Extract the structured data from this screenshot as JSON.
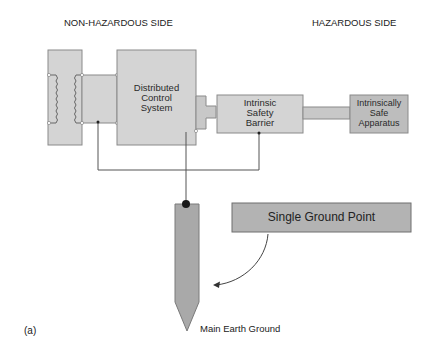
{
  "headings": {
    "left": "NON-HAZARDOUS SIDE",
    "right": "HAZARDOUS SIDE"
  },
  "blocks": {
    "dcs": [
      "Distributed",
      "Control",
      "System"
    ],
    "barrier": [
      "Intrinsic",
      "Safety",
      "Barrier"
    ],
    "apparatus": [
      "Intrinsically",
      "Safe",
      "Apparatus"
    ]
  },
  "callout": "Single Ground Point",
  "ground_label": "Main Earth Ground",
  "figure_label": "(a)",
  "colors": {
    "block_fill": "#d4d4d4",
    "block_stroke": "#8a8a8a",
    "dark_fill": "#a9a9a9",
    "wire": "#555555",
    "dot": "#1a1a1a"
  }
}
